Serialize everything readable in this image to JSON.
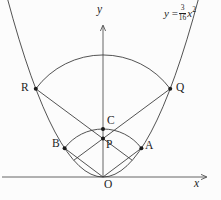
{
  "figure": {
    "background": "#fcfcfc",
    "stroke_color": "#3f3f3f",
    "dot_color": "#1c1c1c",
    "equation": {
      "lhs": "y",
      "equals": "=",
      "numerator": "3",
      "denominator": "16",
      "variable": "x",
      "exponent": "2"
    },
    "axis_labels": {
      "x": "x",
      "y": "y"
    },
    "origin_label": "O",
    "geometry": {
      "origin_px": [
        103,
        177
      ],
      "scale": 9.6,
      "parabola": {
        "a": 0.1875,
        "u_min": -10,
        "u_max": 10
      },
      "axes": {
        "x_start_px": 2,
        "x_end_px": 206,
        "y_top_px": 26
      },
      "arcs": [
        {
          "name": "outer-arc-RQ",
          "center": [
            0,
            4
          ],
          "from": [
            -7,
            9.1875
          ],
          "to": [
            7,
            9.1875
          ]
        },
        {
          "name": "inner-arc-BCA",
          "center": [
            0,
            0
          ],
          "from": [
            -4,
            3
          ],
          "to": [
            4,
            3
          ]
        }
      ],
      "segments": [
        {
          "name": "chord-R-through-P",
          "from": [
            -7,
            9.1875
          ],
          "to": [
            3.0476,
            1.7414
          ]
        },
        {
          "name": "chord-Q-through-P",
          "from": [
            7,
            9.1875
          ],
          "to": [
            -3.0476,
            1.7414
          ]
        },
        {
          "name": "chord-B-O",
          "from": [
            -4,
            3
          ],
          "to": [
            0,
            0
          ]
        },
        {
          "name": "chord-A-O",
          "from": [
            4,
            3
          ],
          "to": [
            0,
            0
          ]
        }
      ],
      "points": [
        {
          "label": "R",
          "coords": [
            -7,
            9.1875
          ],
          "label_px": [
            21,
            82
          ]
        },
        {
          "label": "Q",
          "coords": [
            7,
            9.1875
          ],
          "label_px": [
            176,
            82
          ]
        },
        {
          "label": "B",
          "coords": [
            -4,
            3
          ],
          "label_px": [
            52,
            138
          ]
        },
        {
          "label": "A",
          "coords": [
            4,
            3
          ],
          "label_px": [
            145,
            140
          ]
        },
        {
          "label": "C",
          "coords": [
            0,
            5
          ],
          "label_px": [
            107,
            115
          ]
        },
        {
          "label": "P",
          "coords": [
            0,
            4
          ],
          "label_px": [
            106,
            139
          ]
        }
      ],
      "labels_px": {
        "O": [
          104,
          179
        ],
        "x": [
          194,
          178
        ],
        "y": [
          97,
          4
        ],
        "equation": [
          164,
          4
        ]
      }
    }
  }
}
